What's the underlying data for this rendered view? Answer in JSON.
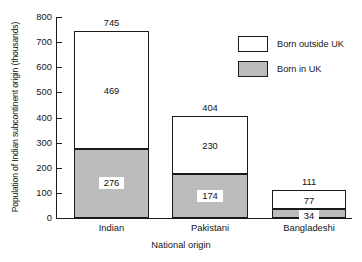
{
  "chart_data": {
    "type": "bar",
    "subtype": "stacked-vertical",
    "title": "",
    "xlabel": "National origin",
    "ylabel": "Population of Indian subcontinent origin (thousands)",
    "categories": [
      "Indian",
      "Pakistani",
      "Bangladeshi"
    ],
    "series": [
      {
        "name": "Born in UK",
        "values": [
          276,
          174,
          34
        ],
        "color": "#bcbcbc"
      },
      {
        "name": "Born outside UK",
        "values": [
          469,
          230,
          77
        ],
        "color": "#ffffff"
      }
    ],
    "totals": [
      745,
      404,
      111
    ],
    "ylim": [
      0,
      800
    ],
    "ytick_step": 100,
    "yticks": [
      0,
      100,
      200,
      300,
      400,
      500,
      600,
      700,
      800
    ],
    "ytick_labels": [
      "0",
      "100",
      "200",
      "300",
      "400",
      "500",
      "600",
      "700",
      "800"
    ],
    "grid": false,
    "legend_position": "top-right",
    "legend_entries": [
      "Born outside UK",
      "Born in UK"
    ]
  },
  "bars": [
    {
      "category": "Indian",
      "total_label": "745",
      "top_label": "469",
      "bottom_label": "276",
      "top_value": 469,
      "bottom_value": 276,
      "total_value": 745
    },
    {
      "category": "Pakistani",
      "total_label": "404",
      "top_label": "230",
      "bottom_label": "174",
      "top_value": 230,
      "bottom_value": 174,
      "total_value": 404
    },
    {
      "category": "Bangladeshi",
      "total_label": "111",
      "top_label": "77",
      "bottom_label": "34",
      "top_value": 77,
      "bottom_value": 34,
      "total_value": 111
    }
  ],
  "axes": {
    "y_title": "Population of Indian subcontinent origin (thousands)",
    "x_title": "National origin",
    "y_ticks": [
      "800",
      "700",
      "600",
      "500",
      "400",
      "300",
      "200",
      "100",
      "0"
    ]
  },
  "legend": {
    "items": [
      {
        "label": "Born outside UK",
        "swatch": "white"
      },
      {
        "label": "Born in UK",
        "swatch": "grey"
      }
    ]
  },
  "colors": {
    "born_in_uk_fill": "#bcbcbc",
    "born_outside_uk_fill": "#ffffff",
    "stroke": "#1a1a1a",
    "background": "#ffffff"
  }
}
